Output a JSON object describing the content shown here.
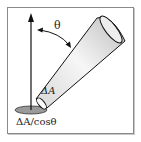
{
  "diagram": {
    "labels": {
      "angle": "θ",
      "cone_area": "ΔA",
      "projected_area": "ΔA/cosθ"
    },
    "colors": {
      "stroke": "#111111",
      "cone_light": "#f4f4f4",
      "cone_dark": "#bdbdbd",
      "ground_ellipse": "#9a9a9a",
      "frame": "#8a8a8a"
    }
  }
}
